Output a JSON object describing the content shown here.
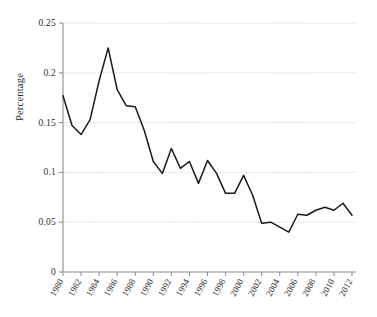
{
  "chart_data": {
    "type": "line",
    "title": "",
    "xlabel": "",
    "ylabel": "Percentage",
    "xlim": [
      1980,
      2012
    ],
    "ylim": [
      0,
      0.25
    ],
    "grid": true,
    "legend": null,
    "line_color": "#1a1a1a",
    "grid_color": "#bfbfbf",
    "axis_color": "#8c8c8c",
    "y_ticks": [
      "0",
      "0.05",
      "0.1",
      "0.15",
      "0.2",
      "0.25"
    ],
    "y_tick_values": [
      0,
      0.05,
      0.1,
      0.15,
      0.2,
      0.25
    ],
    "x_ticks": [
      "1980",
      "1982",
      "1984",
      "1986",
      "1988",
      "1990",
      "1992",
      "1994",
      "1996",
      "1998",
      "2000",
      "2002",
      "2004",
      "2006",
      "2008",
      "2010",
      "2012"
    ],
    "x_tick_values": [
      1980,
      1982,
      1984,
      1986,
      1988,
      1990,
      1992,
      1994,
      1996,
      1998,
      2000,
      2002,
      2004,
      2006,
      2008,
      2010,
      2012
    ],
    "x": [
      1980,
      1981,
      1982,
      1983,
      1984,
      1985,
      1986,
      1987,
      1988,
      1989,
      1990,
      1991,
      1992,
      1993,
      1994,
      1995,
      1996,
      1997,
      1998,
      1999,
      2000,
      2001,
      2002,
      2003,
      2004,
      2005,
      2006,
      2007,
      2008,
      2009,
      2010,
      2011,
      2012
    ],
    "values": [
      0.177,
      0.147,
      0.138,
      0.153,
      0.192,
      0.225,
      0.183,
      0.167,
      0.166,
      0.142,
      0.111,
      0.099,
      0.124,
      0.104,
      0.111,
      0.089,
      0.112,
      0.099,
      0.079,
      0.079,
      0.097,
      0.077,
      0.049,
      0.05,
      0.045,
      0.04,
      0.058,
      0.057,
      0.062,
      0.065,
      0.062,
      0.069,
      0.057
    ]
  }
}
